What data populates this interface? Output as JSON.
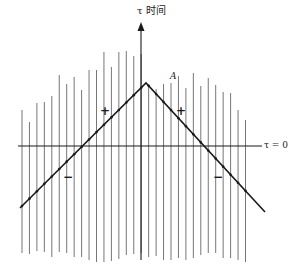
{
  "diagram": {
    "axis_label": "τ 时间",
    "horizontal_axis_label": "τ = 0",
    "vertex_label": "A",
    "signs": [
      {
        "id": "plus-left",
        "text": "+",
        "x": 100,
        "y": 104
      },
      {
        "id": "plus-right",
        "text": "+",
        "x": 176,
        "y": 104
      },
      {
        "id": "minus-left",
        "text": "−",
        "x": 63,
        "y": 170
      },
      {
        "id": "minus-right",
        "text": "−",
        "x": 213,
        "y": 170
      }
    ],
    "colors": {
      "ink": "#1a1a1a",
      "grid_line": "#777777",
      "background": "#ffffff"
    },
    "world_lines": {
      "x_start": 22,
      "spacing": 7.45,
      "tops": [
        110,
        122,
        103,
        102,
        96,
        75,
        84,
        77,
        90,
        70,
        70,
        52,
        67,
        52,
        51,
        56,
        54,
        86,
        89,
        84,
        83,
        76,
        88,
        73,
        86,
        78,
        85,
        92,
        93,
        110,
        120
      ],
      "bottoms": [
        253,
        254,
        251,
        252,
        257,
        252,
        253,
        257,
        257,
        260,
        262,
        262,
        261,
        259,
        255,
        254,
        253,
        257,
        256,
        260,
        260,
        258,
        260,
        258,
        255,
        253,
        253,
        258,
        258,
        260,
        262
      ]
    },
    "time_axis": {
      "x": 141,
      "top": 22,
      "bottom": 260
    },
    "space_axis": {
      "y": 146,
      "left": 18,
      "right": 262
    },
    "kinked_line": {
      "points": [
        [
          20,
          208
        ],
        [
          146,
          83
        ],
        [
          265,
          212
        ]
      ]
    }
  }
}
